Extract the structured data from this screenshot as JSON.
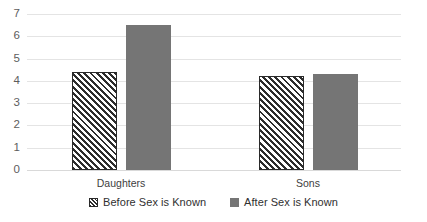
{
  "chart_data": {
    "type": "bar",
    "title": "",
    "subtitle": "",
    "xlabel": "",
    "ylabel": "",
    "categories": [
      "Daughters",
      "Sons"
    ],
    "series": [
      {
        "name": "Before Sex is Known",
        "values": [
          4.4,
          4.2
        ],
        "style": "hatched",
        "color": "#FFFFFF",
        "hatch_color": "#2D2D2D"
      },
      {
        "name": "After Sex is Known",
        "values": [
          6.5,
          4.3
        ],
        "style": "solid",
        "color": "#757575",
        "hatch_color": ""
      }
    ],
    "ylim": [
      0,
      7
    ],
    "yticks": [
      0,
      1,
      2,
      3,
      4,
      5,
      6,
      7
    ],
    "ytick_labels": [
      "0",
      "1",
      "2",
      "3",
      "4",
      "5",
      "6",
      "7"
    ],
    "grid": "horizontal",
    "legend_position": "bottom",
    "annotations": [],
    "colors": {
      "gridline": "#E4E4E4",
      "axis_line": "#D9D9D9",
      "tick_text": "#5D5D5D",
      "label_text": "#404040",
      "legend_text": "#303030",
      "background": "#FFFFFF"
    }
  },
  "axis": {
    "y_tick_labels": [
      "7",
      "6",
      "5",
      "4",
      "3",
      "2",
      "1",
      "0"
    ],
    "x_tick_labels": [
      "Daughters",
      "Sons"
    ]
  },
  "legend": {
    "entries": [
      {
        "label": "Before Sex is Known",
        "swatch": "hatched-swatch-icon"
      },
      {
        "label": "After Sex is Known",
        "swatch": "solid-swatch-icon"
      }
    ]
  }
}
